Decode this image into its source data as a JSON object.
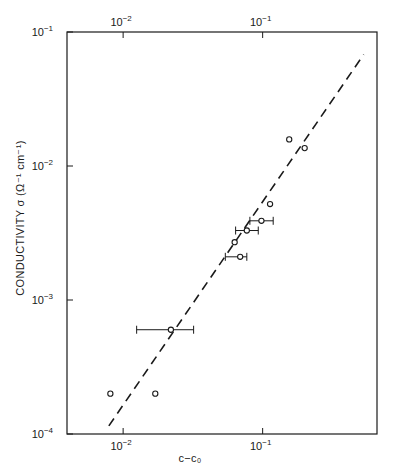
{
  "chart_data": {
    "type": "scatter",
    "title": "",
    "xlabel": "c−c₀",
    "ylabel": "CONDUCTIVITY σ (Ω⁻¹ cm⁻¹)",
    "xscale": "log",
    "yscale": "log",
    "xlim": [
      0.00396,
      0.66
    ],
    "ylim": [
      0.0001,
      0.1
    ],
    "grid": false,
    "legend": null,
    "x_ticks": [
      {
        "value": 0.01,
        "label": "10",
        "exp": "−2"
      },
      {
        "value": 0.1,
        "label": "10",
        "exp": "−1"
      }
    ],
    "top_x_ticks": [
      {
        "value": 0.01,
        "label": "10",
        "exp": "−2"
      },
      {
        "value": 0.1,
        "label": "10",
        "exp": "−1"
      }
    ],
    "y_ticks": [
      {
        "value": 0.1,
        "label": "10",
        "exp": "−1"
      },
      {
        "value": 0.01,
        "label": "10",
        "exp": "−2"
      },
      {
        "value": 0.001,
        "label": "10",
        "exp": "−3"
      },
      {
        "value": 0.0001,
        "label": "10",
        "exp": "−4"
      }
    ],
    "series": [
      {
        "name": "measured conductivity",
        "marker": "open-circle",
        "points": [
          {
            "x": 0.155,
            "y": 0.0158
          },
          {
            "x": 0.2,
            "y": 0.0136
          },
          {
            "x": 0.113,
            "y": 0.0052
          },
          {
            "x": 0.098,
            "y": 0.0039,
            "xerr": [
              0.081,
              0.119
            ]
          },
          {
            "x": 0.077,
            "y": 0.0033,
            "xerr": [
              0.064,
              0.093
            ]
          },
          {
            "x": 0.063,
            "y": 0.0027
          },
          {
            "x": 0.069,
            "y": 0.0021,
            "xerr": [
              0.054,
              0.077
            ]
          },
          {
            "x": 0.022,
            "y": 0.0006,
            "xerr": [
              0.0125,
              0.032
            ]
          },
          {
            "x": 0.0081,
            "y": 0.0002
          },
          {
            "x": 0.017,
            "y": 0.0002
          }
        ]
      },
      {
        "name": "fit line",
        "style": "dashed",
        "points": [
          {
            "x": 0.0079,
            "y": 0.000115
          },
          {
            "x": 0.53,
            "y": 0.068
          }
        ]
      }
    ]
  },
  "colors": {
    "ink": "#1a1a1a",
    "background": "#ffffff"
  }
}
